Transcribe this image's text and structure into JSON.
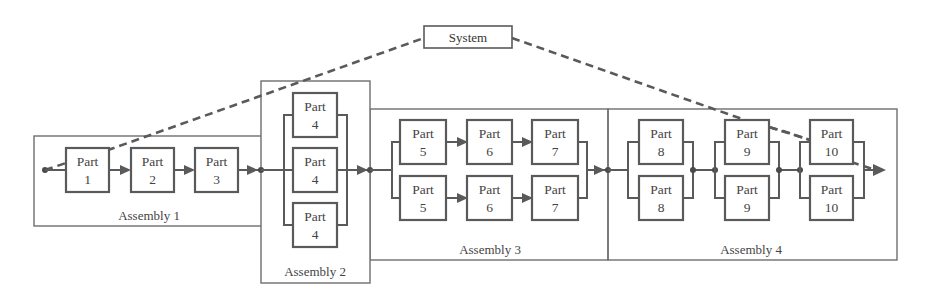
{
  "diagram": {
    "title": "System",
    "assemblies": [
      {
        "label": "Assembly 1",
        "structure": "series",
        "parts": [
          "1",
          "2",
          "3"
        ]
      },
      {
        "label": "Assembly 2",
        "structure": "parallel",
        "parts": [
          "4",
          "4",
          "4"
        ]
      },
      {
        "label": "Assembly 3",
        "structure": "parallel-of-series",
        "branches": [
          [
            "5",
            "6",
            "7"
          ],
          [
            "5",
            "6",
            "7"
          ]
        ]
      },
      {
        "label": "Assembly 4",
        "structure": "series-of-parallel",
        "groups": [
          [
            "8",
            "8"
          ],
          [
            "9",
            "9"
          ],
          [
            "10",
            "10"
          ]
        ]
      }
    ],
    "part_word": "Part",
    "colors": {
      "line": "#5a5a5a",
      "frame": "#6e6e6e",
      "text": "#444444",
      "background": "#ffffff"
    }
  },
  "labels": {
    "system": "System",
    "a1": "Assembly 1",
    "a2": "Assembly 2",
    "a3": "Assembly 3",
    "a4": "Assembly 4",
    "part": "Part",
    "n1": "1",
    "n2": "2",
    "n3": "3",
    "n4": "4",
    "n5": "5",
    "n6": "6",
    "n7": "7",
    "n8": "8",
    "n9": "9",
    "n10": "10"
  }
}
